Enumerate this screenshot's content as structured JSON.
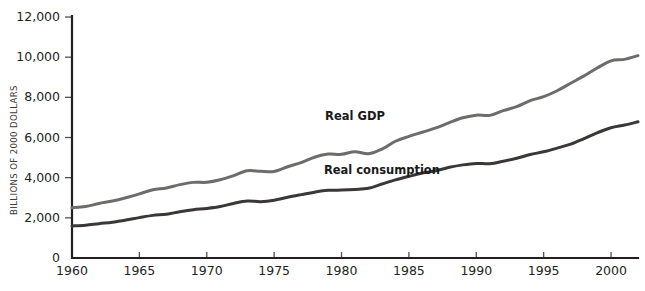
{
  "chart_data": {
    "type": "line",
    "title": "",
    "subtitle": "",
    "xlabel": "",
    "ylabel": "BILLIONS OF 2000 DOLLARS",
    "xlim": [
      1960,
      2002
    ],
    "ylim": [
      0,
      12000
    ],
    "grid": false,
    "legend_position": "inline-annotations",
    "y_ticks": [
      0,
      2000,
      4000,
      6000,
      8000,
      10000,
      12000
    ],
    "y_tick_labels": [
      "0",
      "2,000",
      "4,000",
      "6,000",
      "8,000",
      "10,000",
      "12,000"
    ],
    "x_ticks": [
      1960,
      1965,
      1970,
      1975,
      1980,
      1985,
      1990,
      1995,
      2000
    ],
    "x_tick_labels": [
      "1960",
      "1965",
      "1970",
      "1975",
      "1980",
      "1985",
      "1990",
      "1995",
      "2000"
    ],
    "x": [
      1960,
      1961,
      1962,
      1963,
      1964,
      1965,
      1966,
      1967,
      1968,
      1969,
      1970,
      1971,
      1972,
      1973,
      1974,
      1975,
      1976,
      1977,
      1978,
      1979,
      1980,
      1981,
      1982,
      1983,
      1984,
      1985,
      1986,
      1987,
      1988,
      1989,
      1990,
      1991,
      1992,
      1993,
      1994,
      1995,
      1996,
      1997,
      1998,
      1999,
      2000,
      2001,
      2002
    ],
    "series": [
      {
        "name": "Real GDP",
        "color": "#6e6c6b",
        "label_x": 1981,
        "label_y": 6850,
        "values": [
          2502,
          2560,
          2715,
          2834,
          2999,
          3192,
          3400,
          3485,
          3653,
          3766,
          3772,
          3899,
          4105,
          4342,
          4320,
          4311,
          4541,
          4751,
          5015,
          5173,
          5162,
          5292,
          5189,
          5424,
          5814,
          6054,
          6264,
          6475,
          6743,
          6981,
          7113,
          7101,
          7337,
          7533,
          7836,
          8032,
          8329,
          8704,
          9067,
          9470,
          9817,
          9891,
          10075
        ]
      },
      {
        "name": "Real consumption",
        "color": "#3a3736",
        "label_x": 1983,
        "label_y": 4200,
        "values": [
          1597,
          1630,
          1711,
          1781,
          1889,
          2011,
          2122,
          2178,
          2307,
          2401,
          2467,
          2562,
          2718,
          2834,
          2807,
          2877,
          3025,
          3155,
          3279,
          3369,
          3380,
          3413,
          3473,
          3682,
          3888,
          4065,
          4229,
          4343,
          4515,
          4637,
          4710,
          4695,
          4821,
          4969,
          5151,
          5291,
          5471,
          5666,
          5947,
          6241,
          6487,
          6621,
          6784
        ]
      }
    ],
    "annotations": [
      {
        "text": "Real GDP",
        "series": "Real GDP"
      },
      {
        "text": "Real consumption",
        "series": "Real consumption"
      }
    ]
  }
}
